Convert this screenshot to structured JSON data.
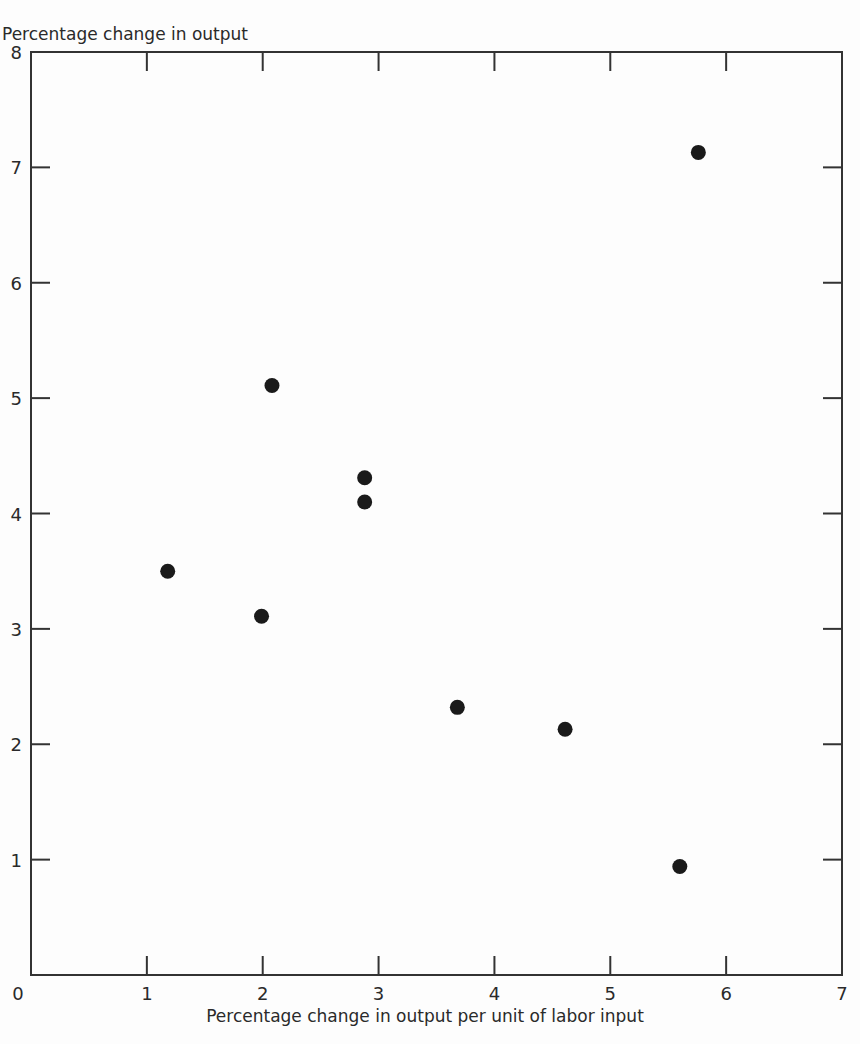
{
  "chart_data": {
    "type": "scatter",
    "title": "",
    "xlabel": "Percentage change in output per unit of labor input",
    "ylabel": "Percentage change in output",
    "xlim": [
      0,
      7
    ],
    "ylim": [
      0,
      8
    ],
    "x_ticks": [
      0,
      1,
      2,
      3,
      4,
      5,
      6,
      7
    ],
    "y_ticks": [
      1,
      2,
      3,
      4,
      5,
      6,
      7,
      8
    ],
    "x_tick_labels": [
      "0",
      "1",
      "2",
      "3",
      "4",
      "5",
      "6",
      "7"
    ],
    "y_tick_labels": [
      "1",
      "2",
      "3",
      "4",
      "5",
      "6",
      "7",
      "8"
    ],
    "grid": false,
    "legend": null,
    "frame": "box with inward ticks on all four sides",
    "marker": "filled circle",
    "marker_color": "#1a1a1a",
    "series": [
      {
        "name": "observations",
        "points": [
          {
            "x": 1.18,
            "y": 3.5
          },
          {
            "x": 1.99,
            "y": 3.11
          },
          {
            "x": 2.08,
            "y": 5.11
          },
          {
            "x": 2.88,
            "y": 4.31
          },
          {
            "x": 2.88,
            "y": 4.1
          },
          {
            "x": 3.68,
            "y": 2.32
          },
          {
            "x": 4.61,
            "y": 2.13
          },
          {
            "x": 5.6,
            "y": 0.94
          },
          {
            "x": 5.76,
            "y": 7.13
          }
        ]
      }
    ]
  }
}
